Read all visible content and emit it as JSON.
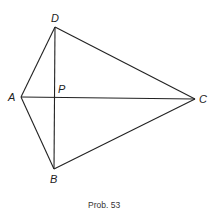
{
  "diagram": {
    "caption": "Prob. 53",
    "points": {
      "A": {
        "label": "A",
        "x": 21,
        "y": 97
      },
      "B": {
        "label": "B",
        "x": 54,
        "y": 169
      },
      "C": {
        "label": "C",
        "x": 195,
        "y": 99
      },
      "D": {
        "label": "D",
        "x": 55,
        "y": 27
      },
      "P": {
        "label": "P",
        "x": 55,
        "y": 97
      }
    },
    "segments": [
      [
        "A",
        "D"
      ],
      [
        "D",
        "C"
      ],
      [
        "C",
        "B"
      ],
      [
        "B",
        "A"
      ],
      [
        "A",
        "C"
      ],
      [
        "D",
        "B"
      ]
    ]
  }
}
